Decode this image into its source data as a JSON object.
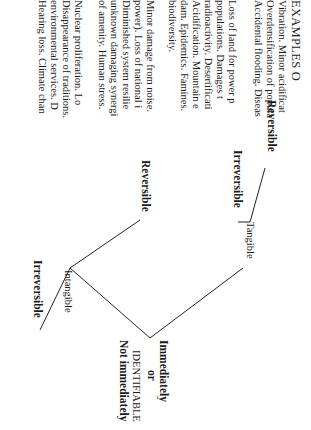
{
  "diagram": {
    "root": "IDENTIFIABLE",
    "timing": {
      "first": "Immediately",
      "connector": "or",
      "second": "Not immediately"
    },
    "branches": [
      {
        "label": "Tangible",
        "children": [
          "Reversible",
          "Irreversible"
        ]
      },
      {
        "label": "Intangible",
        "children": [
          "Reversible",
          "Irreversible"
        ]
      }
    ],
    "examples_header": "EXAMPLES O",
    "examples": {
      "tangible_reversible": [
        "Vibration. Minor acidificat",
        "Overdensification of popula",
        "Accidental flooding. Diseas"
      ],
      "tangible_irreversible": [
        "Loss of land for power p",
        "populations.  Damages  t",
        "radioactivity.  Desertificati",
        "Acidification.  Mountain  e",
        "dam.  Epidemics.  Famines.",
        "biodiversity."
      ],
      "intangible_reversible": [
        "Minor damage from noise.",
        "power). Loss of national i",
        "Diminished  system  resilie",
        "unknown damaging synergi",
        "of amenity. Human stress."
      ],
      "intangible_irreversible": [
        "Nuclear  proliferation.  Lo",
        "Disappearance of traditions.",
        "environmental  services.  D",
        "Hearing loss. Climate chan"
      ]
    }
  }
}
